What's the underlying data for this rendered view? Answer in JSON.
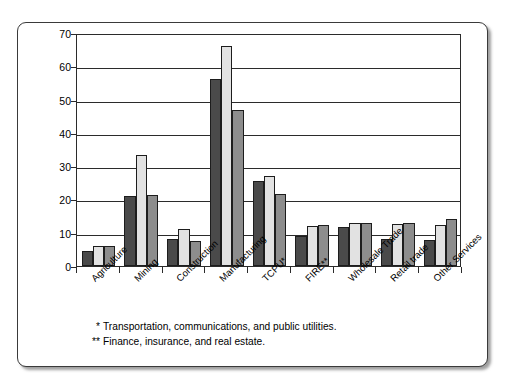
{
  "chart_data": {
    "type": "bar",
    "title": "",
    "xlabel": "",
    "ylabel": "Number of Employees",
    "ylim": [
      0,
      70
    ],
    "ytick_step": 10,
    "yticks": [
      0,
      10,
      20,
      30,
      40,
      50,
      60,
      70
    ],
    "grid": true,
    "legend_position": "top-right-inside",
    "categories": [
      "Agriculture",
      "Mining",
      "Construction",
      "Manufacturing",
      "TCPU*",
      "FIRE**",
      "Wholesale Trade",
      "Retail trade",
      "Other Services"
    ],
    "series": [
      {
        "name": "1962",
        "color": "#4a4a4a",
        "values": [
          4.5,
          21.0,
          8.2,
          56.3,
          25.5,
          9.0,
          11.8,
          8.0,
          7.8
        ]
      },
      {
        "name": "1980",
        "color": "#e2e2e2",
        "values": [
          6.0,
          33.5,
          11.0,
          66.0,
          27.0,
          12.0,
          13.0,
          12.5,
          12.3
        ]
      },
      {
        "name": "1993",
        "color": "#8d8d8d",
        "values": [
          6.0,
          21.2,
          7.5,
          47.0,
          21.5,
          12.3,
          13.0,
          12.8,
          14.0
        ]
      }
    ],
    "footnotes": [
      {
        "mark": "*",
        "text": "Transportation, communications, and public utilities."
      },
      {
        "mark": "**",
        "text": "Finance, insurance, and real estate."
      }
    ]
  }
}
